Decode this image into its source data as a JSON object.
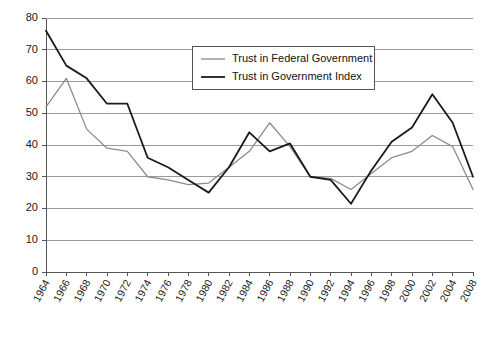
{
  "chart_data": {
    "type": "line",
    "title": "",
    "subtitle": "",
    "xlabel": "",
    "ylabel": "",
    "grid": true,
    "legend_position": "top-center-right",
    "xlim_labels": [
      "1964",
      "2008"
    ],
    "ylim": [
      0,
      80
    ],
    "ytick_step": 10,
    "yticks": [
      0,
      10,
      20,
      30,
      40,
      50,
      60,
      70,
      80
    ],
    "ytick_labels": [
      "0",
      "10",
      "20",
      "30",
      "40",
      "50",
      "60",
      "70",
      "80"
    ],
    "categories": [
      "1964",
      "1966",
      "1968",
      "1970",
      "1972",
      "1974",
      "1976",
      "1978",
      "1980",
      "1982",
      "1984",
      "1986",
      "1988",
      "1990",
      "1992",
      "1994",
      "1996",
      "1998",
      "2000",
      "2002",
      "2004",
      "2008"
    ],
    "series": [
      {
        "name": "Trust in Federal Government",
        "color": "#8c8c8c",
        "width": 1.3,
        "values": [
          52,
          61,
          45,
          39,
          38,
          30,
          29,
          27.5,
          28,
          33,
          38,
          47,
          39.5,
          30,
          29.5,
          26,
          31,
          36,
          38,
          43,
          39.5,
          26
        ]
      },
      {
        "name": "Trust in Government Index",
        "color": "#1a1a1a",
        "width": 1.8,
        "values": [
          76,
          65,
          61,
          53,
          53,
          36,
          33,
          29,
          25,
          33,
          44,
          38,
          40.5,
          30,
          29,
          21.5,
          32,
          41,
          45.5,
          56,
          47,
          30
        ]
      }
    ]
  },
  "legend": {
    "entries": [
      {
        "label": "Trust in Federal Government",
        "swatch": "#8c8c8c"
      },
      {
        "label": "Trust in Government Index",
        "swatch": "#1a1a1a"
      }
    ]
  }
}
